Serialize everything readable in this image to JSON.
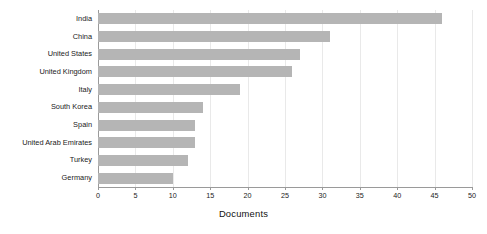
{
  "chart_data": {
    "type": "bar",
    "orientation": "horizontal",
    "title": "",
    "subtitle": "",
    "xlabel": "Documents",
    "ylabel": "",
    "categories": [
      "India",
      "China",
      "United States",
      "United Kingdom",
      "Italy",
      "South Korea",
      "Spain",
      "United Arab Emirates",
      "Turkey",
      "Germany"
    ],
    "values": [
      46,
      31,
      27,
      26,
      19,
      14,
      13,
      13,
      12,
      10
    ],
    "xlim": [
      0,
      50
    ],
    "xticks": [
      0,
      5,
      10,
      15,
      20,
      25,
      30,
      35,
      40,
      45,
      50
    ],
    "xtick_labels": [
      "0",
      "5",
      "10",
      "15",
      "20",
      "25",
      "30",
      "35",
      "40",
      "45",
      "50"
    ],
    "grid": "vertical",
    "legend": null,
    "legend_position": "none",
    "bar_color": "#b5b5b5",
    "axis_color": "#9a9a9a",
    "grid_color": "#e9e9e9",
    "text_color": "#1a1a1a",
    "background": "#ffffff"
  }
}
